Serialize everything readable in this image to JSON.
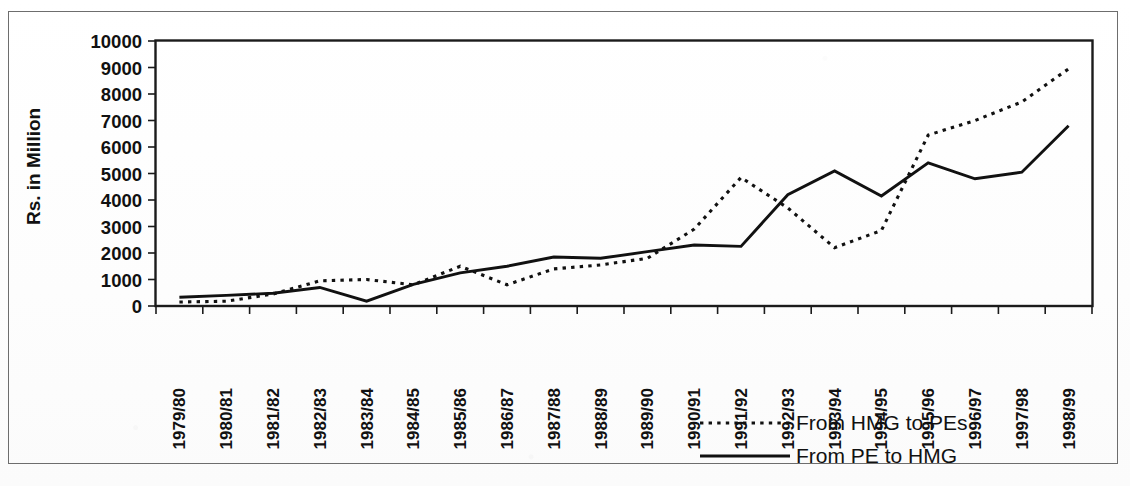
{
  "figure": {
    "name": "transfer-flows-line-chart",
    "background_color": "#fdfdfd",
    "ink_color": "#111111",
    "frame_color": "#6d6d6d"
  },
  "chart_data": {
    "type": "line",
    "title": "",
    "subtitle": "",
    "xlabel": "",
    "ylabel": "Rs. in Million",
    "ylim": [
      0,
      10000
    ],
    "ytick_values": [
      0,
      1000,
      2000,
      3000,
      4000,
      5000,
      6000,
      7000,
      8000,
      9000,
      10000
    ],
    "ytick_labels": [
      "0",
      "1000",
      "2000",
      "3000",
      "4000",
      "5000",
      "6000",
      "7000",
      "8000",
      "9000",
      "10000"
    ],
    "grid": false,
    "legend_position": "bottom-right",
    "categories": [
      "1979/80",
      "1980/81",
      "1981/82",
      "1982/83",
      "1983/84",
      "1984/85",
      "1985/86",
      "1986/87",
      "1987/88",
      "1988/89",
      "1989/90",
      "1990/91",
      "1991/92",
      "1992/93",
      "1993/94",
      "1994/95",
      "1995/96",
      "1996/97",
      "1997/98",
      "1998/99"
    ],
    "series": [
      {
        "name": "From HMG to PEs",
        "style": "dotted",
        "color": "#111111",
        "values": [
          150,
          180,
          450,
          950,
          1000,
          800,
          1500,
          800,
          1400,
          1550,
          1800,
          2900,
          4850,
          3700,
          2200,
          2850,
          6450,
          7000,
          7700,
          8950
        ]
      },
      {
        "name": "From PE to HMG",
        "style": "solid",
        "color": "#111111",
        "values": [
          330,
          400,
          480,
          700,
          180,
          820,
          1250,
          1500,
          1850,
          1800,
          2050,
          2300,
          2250,
          4200,
          5100,
          4150,
          5400,
          4800,
          5050,
          6800
        ]
      }
    ]
  },
  "legend": {
    "entries": [
      {
        "label": "From HMG to PEs",
        "style": "dotted"
      },
      {
        "label": "From PE to HMG",
        "style": "solid"
      }
    ]
  },
  "axis": {
    "y_title": "Rs. in Million"
  }
}
